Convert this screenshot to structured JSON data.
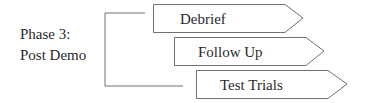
{
  "phase": {
    "line1": "Phase 3:",
    "line2": "Post Demo"
  },
  "steps": [
    {
      "label": "Debrief"
    },
    {
      "label": "Follow Up"
    },
    {
      "label": "Test Trials"
    }
  ],
  "colors": {
    "stroke": "#707070",
    "text": "#2a2a2a",
    "background": "#ffffff"
  }
}
